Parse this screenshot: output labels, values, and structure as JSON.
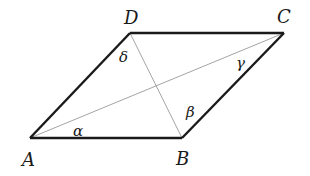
{
  "figure": {
    "type": "parallelogram",
    "vertices": {
      "A": {
        "label": "A",
        "x": 30,
        "y": 138
      },
      "B": {
        "label": "B",
        "x": 182,
        "y": 138
      },
      "C": {
        "label": "C",
        "x": 284,
        "y": 33
      },
      "D": {
        "label": "D",
        "x": 130,
        "y": 33
      }
    },
    "vertex_labels": {
      "A": {
        "text": "A",
        "x": 22,
        "y": 166
      },
      "B": {
        "text": "B",
        "x": 176,
        "y": 165
      },
      "C": {
        "text": "C",
        "x": 277,
        "y": 23
      },
      "D": {
        "text": "D",
        "x": 124,
        "y": 24
      }
    },
    "angle_labels": {
      "alpha": {
        "text": "α",
        "x": 73,
        "y": 136
      },
      "beta": {
        "text": "β",
        "x": 186,
        "y": 117
      },
      "gamma": {
        "text": "γ",
        "x": 236,
        "y": 68
      },
      "delta": {
        "text": "δ",
        "x": 119,
        "y": 62
      }
    },
    "colors": {
      "edge": "#1a1a1a",
      "diagonal": "#9a9a9a"
    }
  }
}
